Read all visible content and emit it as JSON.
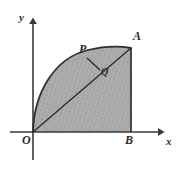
{
  "figure": {
    "background_color": "#ffffff",
    "stroke_color": "#3a3a3a",
    "shade_color": "#a9a9a9",
    "label_color": "#2b2b2b",
    "axes": {
      "x_label": "x",
      "y_label": "y",
      "origin_label": "O",
      "x_axis_from": [
        10,
        132
      ],
      "x_axis_to": [
        168,
        132
      ],
      "y_axis_from": [
        33,
        160
      ],
      "y_axis_to": [
        33,
        14
      ],
      "arrow_style": "solid-triangle"
    },
    "points": [
      {
        "name": "O",
        "label": "O",
        "x": 33,
        "y": 132,
        "on": "origin"
      },
      {
        "name": "A",
        "label": "A",
        "x": 131,
        "y": 48,
        "on": "arc-end-top-right"
      },
      {
        "name": "B",
        "label": "B",
        "x": 131,
        "y": 132,
        "on": "x-axis"
      },
      {
        "name": "P",
        "label": "P",
        "x": 87,
        "y": 58,
        "on": "arc"
      },
      {
        "name": "Q",
        "label": "Q",
        "x": 100,
        "y": 70,
        "on": "diagonal-OA"
      }
    ],
    "segments": [
      {
        "name": "diagonal-OA",
        "from": "O",
        "to": "A",
        "style": "solid"
      },
      {
        "name": "perpendicular-PQ",
        "from": "P",
        "to": "Q",
        "style": "solid"
      },
      {
        "name": "right-edge-AB",
        "from": "A",
        "to": "B",
        "style": "solid"
      }
    ],
    "curves": [
      {
        "name": "arc-OA",
        "type": "quarter-arc",
        "from": "O",
        "to": "A",
        "bulge": "outward-upper-left"
      }
    ],
    "shaded_region": {
      "name": "sector-OAB",
      "description": "region bounded by arc OA, segment AB and segment BO",
      "fill": "gray-stipple"
    }
  }
}
